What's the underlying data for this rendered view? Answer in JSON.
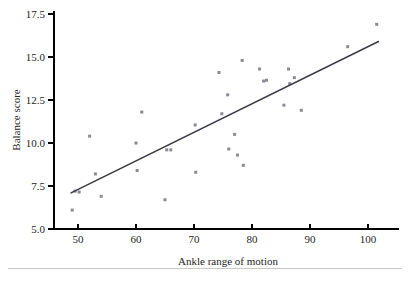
{
  "chart_data": {
    "type": "scatter",
    "title": "",
    "xlabel": "Ankle range of motion",
    "ylabel": "Balance score",
    "xlim": [
      46,
      104
    ],
    "ylim": [
      5.0,
      17.5
    ],
    "grid": false,
    "legend": false,
    "x_ticks": [
      50,
      60,
      70,
      80,
      90,
      100
    ],
    "y_ticks": [
      "5.0",
      "7.5",
      "10.0",
      "12.5",
      "15.0",
      "17.5"
    ],
    "x_tick_labels": [
      "50",
      "60",
      "70",
      "80",
      "90",
      "100"
    ],
    "y_tick_labels": [
      "5.0",
      "7.5",
      "10.0",
      "12.5",
      "15.0",
      "17.5"
    ],
    "points": [
      {
        "x": 49.0,
        "y": 6.1
      },
      {
        "x": 49.5,
        "y": 7.2
      },
      {
        "x": 50.2,
        "y": 7.15
      },
      {
        "x": 52.0,
        "y": 10.4
      },
      {
        "x": 53.0,
        "y": 8.2
      },
      {
        "x": 54.0,
        "y": 6.9
      },
      {
        "x": 60.0,
        "y": 10.0
      },
      {
        "x": 60.2,
        "y": 8.4
      },
      {
        "x": 61.0,
        "y": 11.8
      },
      {
        "x": 65.0,
        "y": 6.7
      },
      {
        "x": 65.3,
        "y": 9.6
      },
      {
        "x": 66.0,
        "y": 9.6
      },
      {
        "x": 70.2,
        "y": 11.05
      },
      {
        "x": 70.3,
        "y": 8.3
      },
      {
        "x": 74.3,
        "y": 14.1
      },
      {
        "x": 74.8,
        "y": 11.7
      },
      {
        "x": 75.8,
        "y": 12.8
      },
      {
        "x": 76.0,
        "y": 9.65
      },
      {
        "x": 77.0,
        "y": 10.5
      },
      {
        "x": 77.5,
        "y": 9.3
      },
      {
        "x": 78.3,
        "y": 14.8
      },
      {
        "x": 78.5,
        "y": 8.7
      },
      {
        "x": 81.3,
        "y": 14.3
      },
      {
        "x": 82.0,
        "y": 13.6
      },
      {
        "x": 82.5,
        "y": 13.65
      },
      {
        "x": 85.5,
        "y": 12.2
      },
      {
        "x": 86.3,
        "y": 14.3
      },
      {
        "x": 86.5,
        "y": 13.45
      },
      {
        "x": 87.3,
        "y": 13.8
      },
      {
        "x": 88.5,
        "y": 11.9
      },
      {
        "x": 96.5,
        "y": 15.6
      },
      {
        "x": 101.5,
        "y": 16.9
      }
    ],
    "fit_line": {
      "name": "least-squares regression line",
      "x_start": 48.8,
      "y_start": 7.1,
      "x_end": 101.8,
      "y_end": 15.9
    },
    "marker": {
      "shape": "square",
      "color": "#8a8a94",
      "size": 3
    },
    "line_color": "#3b3b46"
  }
}
